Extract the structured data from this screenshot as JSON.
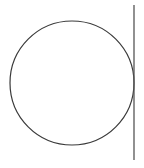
{
  "diagram": {
    "canvas": {
      "width": 144,
      "height": 168,
      "background": "#ffffff"
    },
    "circle": {
      "cx": 72,
      "cy": 83,
      "r": 62,
      "stroke": "#3a3a3a",
      "stroke_width": 1.2,
      "fill": "none"
    },
    "line": {
      "x1": 134,
      "y1": 5,
      "x2": 134,
      "y2": 160,
      "stroke": "#555555",
      "stroke_width": 1.3
    },
    "tangent_point": {
      "x": 134,
      "y": 83
    }
  }
}
